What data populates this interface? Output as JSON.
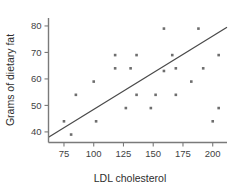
{
  "chart_data": {
    "type": "scatter",
    "title": "",
    "xlabel": "LDL cholesterol",
    "ylabel": "Grams of dietary fat",
    "xlim": [
      62,
      212
    ],
    "ylim": [
      36,
      83
    ],
    "xticks": [
      75,
      100,
      125,
      150,
      175,
      200
    ],
    "yticks": [
      40,
      50,
      60,
      70,
      80
    ],
    "xtick_labels": [
      "75",
      "100",
      "125",
      "150",
      "175",
      "200"
    ],
    "ytick_labels": [
      "40",
      "50",
      "60",
      "70",
      "80"
    ],
    "grid": false,
    "legend": null,
    "marker": "small-square",
    "point_color": "#6e6e6e",
    "line_color": "#4a4a4a",
    "axis_color": "#7a7a7a",
    "points": [
      {
        "x": 75,
        "y": 44
      },
      {
        "x": 81,
        "y": 39
      },
      {
        "x": 85,
        "y": 54
      },
      {
        "x": 100,
        "y": 59
      },
      {
        "x": 102,
        "y": 44
      },
      {
        "x": 118,
        "y": 69
      },
      {
        "x": 118,
        "y": 64
      },
      {
        "x": 127,
        "y": 49
      },
      {
        "x": 131,
        "y": 64
      },
      {
        "x": 136,
        "y": 69
      },
      {
        "x": 136,
        "y": 54
      },
      {
        "x": 148,
        "y": 49
      },
      {
        "x": 152,
        "y": 54
      },
      {
        "x": 159,
        "y": 79
      },
      {
        "x": 159,
        "y": 63
      },
      {
        "x": 166,
        "y": 69
      },
      {
        "x": 169,
        "y": 64
      },
      {
        "x": 169,
        "y": 54
      },
      {
        "x": 182,
        "y": 59
      },
      {
        "x": 188,
        "y": 79
      },
      {
        "x": 192,
        "y": 64
      },
      {
        "x": 200,
        "y": 44
      },
      {
        "x": 205,
        "y": 69
      },
      {
        "x": 205,
        "y": 49
      }
    ],
    "fit_line": {
      "type": "linear-regression",
      "x_start": 62,
      "y_start": 38,
      "x_end": 212,
      "y_end": 79.5
    }
  }
}
